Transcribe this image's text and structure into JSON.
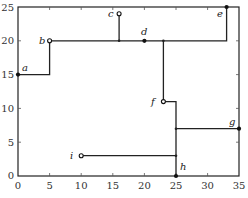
{
  "diagram": {
    "type": "rectilinear-tree",
    "axes": {
      "x_ticks": [
        "0",
        "5",
        "10",
        "15",
        "20",
        "25",
        "30",
        "35"
      ],
      "y_ticks": [
        "0",
        "5",
        "10",
        "15",
        "20",
        "25"
      ],
      "x_range": [
        0,
        35
      ],
      "y_range": [
        0,
        25
      ]
    },
    "points": [
      {
        "label": "a",
        "x": 0,
        "y": 15,
        "style": "filled"
      },
      {
        "label": "b",
        "x": 5,
        "y": 20,
        "style": "open"
      },
      {
        "label": "c",
        "x": 16,
        "y": 24,
        "style": "open"
      },
      {
        "label": "d",
        "x": 20,
        "y": 20,
        "style": "filled"
      },
      {
        "label": "e",
        "x": 33,
        "y": 25,
        "style": "filled"
      },
      {
        "label": "f",
        "x": 23,
        "y": 11,
        "style": "open"
      },
      {
        "label": "g",
        "x": 35,
        "y": 7,
        "style": "filled"
      },
      {
        "label": "h",
        "x": 25,
        "y": 0,
        "style": "filled"
      },
      {
        "label": "i",
        "x": 10,
        "y": 3,
        "style": "open"
      }
    ],
    "segments": [
      [
        [
          0,
          15
        ],
        [
          5,
          15
        ]
      ],
      [
        [
          5,
          15
        ],
        [
          5,
          20
        ]
      ],
      [
        [
          5,
          20
        ],
        [
          33,
          20
        ]
      ],
      [
        [
          33,
          20
        ],
        [
          33,
          25
        ]
      ],
      [
        [
          16,
          24
        ],
        [
          16,
          20
        ]
      ],
      [
        [
          23,
          20
        ],
        [
          23,
          11
        ]
      ],
      [
        [
          23,
          11
        ],
        [
          25,
          11
        ]
      ],
      [
        [
          25,
          11
        ],
        [
          25,
          0
        ]
      ],
      [
        [
          25,
          7
        ],
        [
          35,
          7
        ]
      ],
      [
        [
          10,
          3
        ],
        [
          25,
          3
        ]
      ]
    ]
  },
  "labels": {
    "a": "a",
    "b": "b",
    "c": "c",
    "d": "d",
    "e": "e",
    "f": "f",
    "g": "g",
    "h": "h",
    "i": "i"
  },
  "ticks": {
    "x0": "0",
    "x5": "5",
    "x10": "10",
    "x15": "15",
    "x20": "20",
    "x25": "25",
    "x30": "30",
    "x35": "35",
    "y0": "0",
    "y5": "5",
    "y10": "10",
    "y15": "15",
    "y20": "20",
    "y25": "25"
  }
}
